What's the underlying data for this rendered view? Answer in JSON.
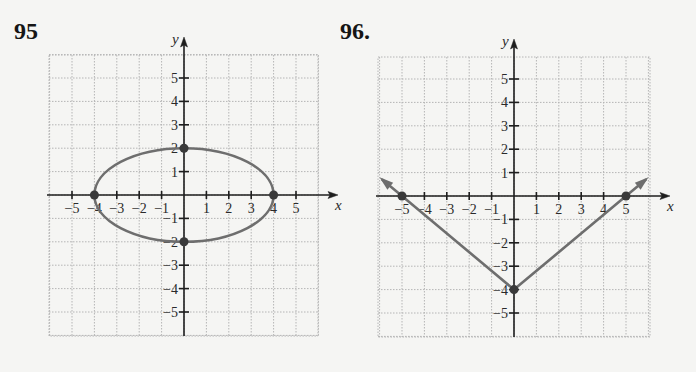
{
  "problems": [
    {
      "number": "95"
    },
    {
      "number": "96."
    }
  ],
  "colors": {
    "axis": "#1e1e1e",
    "grid": "#b5b5b5",
    "curve": "#6e6e6e",
    "point": "#3a3a3a",
    "background": "#f5f5f3"
  },
  "chart_data": [
    {
      "type": "line",
      "title": "95",
      "xlabel": "x",
      "ylabel": "y",
      "xlim": [
        -6,
        6
      ],
      "ylim": [
        -6,
        6
      ],
      "x_ticks": [
        -5,
        -4,
        -3,
        -2,
        -1,
        1,
        2,
        3,
        4,
        5
      ],
      "y_ticks": [
        -5,
        -4,
        -3,
        -2,
        -1,
        1,
        2,
        3,
        4,
        5
      ],
      "grid": true,
      "curve": "ellipse",
      "equation": "x^2/16 + y^2/4 = 1",
      "center": [
        0,
        0
      ],
      "semi_axes": {
        "a": 4,
        "b": 2
      },
      "points": [
        [
          -4,
          0
        ],
        [
          4,
          0
        ],
        [
          0,
          2
        ],
        [
          0,
          -2
        ]
      ]
    },
    {
      "type": "line",
      "title": "96.",
      "xlabel": "x",
      "ylabel": "y",
      "xlim": [
        -6,
        6
      ],
      "ylim": [
        -6,
        6
      ],
      "x_ticks": [
        -5,
        -4,
        -3,
        -2,
        -1,
        1,
        2,
        3,
        4,
        5
      ],
      "y_ticks": [
        -5,
        -4,
        -3,
        -2,
        -1,
        1,
        2,
        3,
        4,
        5
      ],
      "grid": true,
      "curve": "absolute-value V with arrows",
      "equation": "y = (4/5)|x| - 4",
      "vertex": [
        0,
        -4
      ],
      "points": [
        [
          -5,
          0
        ],
        [
          5,
          0
        ],
        [
          0,
          -4
        ]
      ],
      "series": [
        {
          "name": "left ray",
          "x": [
            0,
            -5,
            -5.9
          ],
          "y": [
            -4,
            0,
            0.72
          ]
        },
        {
          "name": "right ray",
          "x": [
            0,
            5,
            5.9
          ],
          "y": [
            -4,
            0,
            0.72
          ]
        }
      ]
    }
  ]
}
